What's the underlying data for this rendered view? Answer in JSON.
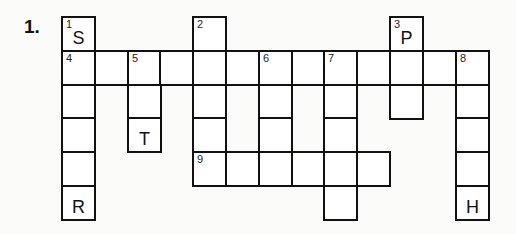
{
  "puzzle": {
    "label": "1.",
    "grid": {
      "cols": 13,
      "rows": 6,
      "origin_x": 62,
      "origin_y": 17,
      "cell_w": 32.8,
      "cell_h": 33.8
    },
    "cells": [
      {
        "r": 0,
        "c": 0,
        "num": "1",
        "letter": "S"
      },
      {
        "r": 0,
        "c": 4,
        "num": "2",
        "letter": ""
      },
      {
        "r": 0,
        "c": 10,
        "num": "3",
        "letter": "P"
      },
      {
        "r": 1,
        "c": 0,
        "num": "4",
        "letter": ""
      },
      {
        "r": 1,
        "c": 1,
        "num": "",
        "letter": ""
      },
      {
        "r": 1,
        "c": 2,
        "num": "5",
        "letter": ""
      },
      {
        "r": 1,
        "c": 3,
        "num": "",
        "letter": ""
      },
      {
        "r": 1,
        "c": 4,
        "num": "",
        "letter": ""
      },
      {
        "r": 1,
        "c": 5,
        "num": "",
        "letter": ""
      },
      {
        "r": 1,
        "c": 6,
        "num": "6",
        "letter": ""
      },
      {
        "r": 1,
        "c": 7,
        "num": "",
        "letter": ""
      },
      {
        "r": 1,
        "c": 8,
        "num": "7",
        "letter": ""
      },
      {
        "r": 1,
        "c": 9,
        "num": "",
        "letter": ""
      },
      {
        "r": 1,
        "c": 10,
        "num": "",
        "letter": ""
      },
      {
        "r": 1,
        "c": 11,
        "num": "",
        "letter": ""
      },
      {
        "r": 1,
        "c": 12,
        "num": "8",
        "letter": ""
      },
      {
        "r": 2,
        "c": 0,
        "num": "",
        "letter": ""
      },
      {
        "r": 2,
        "c": 2,
        "num": "",
        "letter": ""
      },
      {
        "r": 2,
        "c": 4,
        "num": "",
        "letter": ""
      },
      {
        "r": 2,
        "c": 6,
        "num": "",
        "letter": ""
      },
      {
        "r": 2,
        "c": 8,
        "num": "",
        "letter": ""
      },
      {
        "r": 2,
        "c": 10,
        "num": "",
        "letter": ""
      },
      {
        "r": 2,
        "c": 12,
        "num": "",
        "letter": ""
      },
      {
        "r": 3,
        "c": 0,
        "num": "",
        "letter": ""
      },
      {
        "r": 3,
        "c": 2,
        "num": "",
        "letter": "T"
      },
      {
        "r": 3,
        "c": 4,
        "num": "",
        "letter": ""
      },
      {
        "r": 3,
        "c": 6,
        "num": "",
        "letter": ""
      },
      {
        "r": 3,
        "c": 8,
        "num": "",
        "letter": ""
      },
      {
        "r": 3,
        "c": 12,
        "num": "",
        "letter": ""
      },
      {
        "r": 4,
        "c": 0,
        "num": "",
        "letter": ""
      },
      {
        "r": 4,
        "c": 4,
        "num": "9",
        "letter": ""
      },
      {
        "r": 4,
        "c": 5,
        "num": "",
        "letter": ""
      },
      {
        "r": 4,
        "c": 6,
        "num": "",
        "letter": ""
      },
      {
        "r": 4,
        "c": 7,
        "num": "",
        "letter": ""
      },
      {
        "r": 4,
        "c": 8,
        "num": "",
        "letter": ""
      },
      {
        "r": 4,
        "c": 9,
        "num": "",
        "letter": ""
      },
      {
        "r": 4,
        "c": 12,
        "num": "",
        "letter": ""
      },
      {
        "r": 5,
        "c": 0,
        "num": "",
        "letter": "R"
      },
      {
        "r": 5,
        "c": 8,
        "num": "",
        "letter": ""
      },
      {
        "r": 5,
        "c": 12,
        "num": "",
        "letter": "H"
      }
    ],
    "clues_implied": {
      "down": [
        {
          "num": "1",
          "cells": 6,
          "start": "S",
          "end": "R"
        },
        {
          "num": "2",
          "cells": 5
        },
        {
          "num": "3",
          "cells": 3,
          "start": "P"
        },
        {
          "num": "5",
          "cells": 3,
          "end": "T"
        },
        {
          "num": "6",
          "cells": 3
        },
        {
          "num": "7",
          "cells": 5
        },
        {
          "num": "8",
          "cells": 5,
          "end": "H"
        }
      ],
      "across": [
        {
          "num": "4",
          "cells": 13
        },
        {
          "num": "9",
          "cells": 6
        }
      ]
    }
  }
}
